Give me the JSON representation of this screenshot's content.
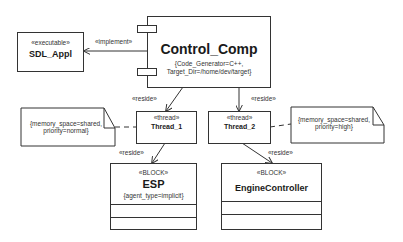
{
  "nodes": {
    "sdl_appl": {
      "stereotype": "«executable»",
      "name": "SDL_Appl"
    },
    "control_comp": {
      "name": "Control_Comp",
      "tagged_line1": "{Code_Generator=C++,",
      "tagged_line2": "Target_Dir=/home/dev/target}"
    },
    "thread_1": {
      "stereotype": "«thread»",
      "name": "Thread_1"
    },
    "thread_2": {
      "stereotype": "«thread»",
      "name": "Thread_2"
    },
    "esp": {
      "stereotype": "«BLOCK»",
      "name": "ESP",
      "tagged": "{agent_type=implicit}"
    },
    "engine_controller": {
      "stereotype": "«BLOCK»",
      "name": "EngineController"
    }
  },
  "notes": {
    "note_1": {
      "line1": "{memory_space=shared,",
      "line2": "priority=normal}"
    },
    "note_2": {
      "line1": "{memory_space=shared,",
      "line2": "priority=high}"
    }
  },
  "edges": {
    "implement": "«implement»",
    "reside_thread1": "«reside»",
    "reside_thread2": "«reside»",
    "reside_esp": "«reside»",
    "reside_engine": "«reside»"
  }
}
